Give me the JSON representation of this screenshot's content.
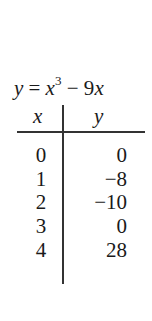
{
  "title": {
    "lhs": "y",
    "eq": "=",
    "base": "x",
    "exponent": "3",
    "minus": "−",
    "term": "9x"
  },
  "table": {
    "headers": [
      "x",
      "y"
    ],
    "rows": [
      {
        "x": "0",
        "y": "0"
      },
      {
        "x": "1",
        "y": "−8"
      },
      {
        "x": "2",
        "y": "−10"
      },
      {
        "x": "3",
        "y": "0"
      },
      {
        "x": "4",
        "y": "28"
      }
    ]
  }
}
